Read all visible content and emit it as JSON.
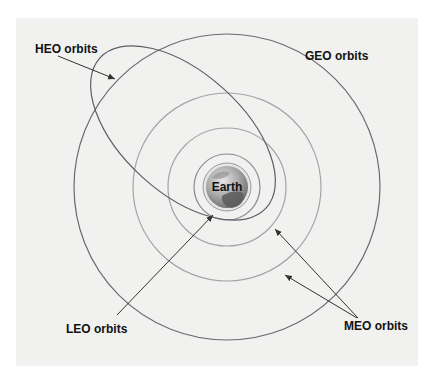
{
  "diagram": {
    "labels": {
      "heo": "HEO orbits",
      "geo": "GEO orbits",
      "leo": "LEO orbits",
      "meo": "MEO orbits",
      "earth": "Earth"
    },
    "orbits": [
      {
        "type": "LEO",
        "shape": "circle",
        "count": 1
      },
      {
        "type": "MEO",
        "shape": "circle",
        "count": 2
      },
      {
        "type": "GEO",
        "shape": "circle",
        "count": 1
      },
      {
        "type": "HEO",
        "shape": "ellipse",
        "count": 1
      }
    ],
    "colors": {
      "background": "#f1f1f0",
      "geo_line": "#6a6a72",
      "heo_line": "#5e5e66",
      "meo_line": "#a4a4a8",
      "leo_line": "#8a8a90",
      "arrow": "#333333",
      "earth_light": "#d9d9d9",
      "earth_dark": "#5a5a5a"
    }
  }
}
